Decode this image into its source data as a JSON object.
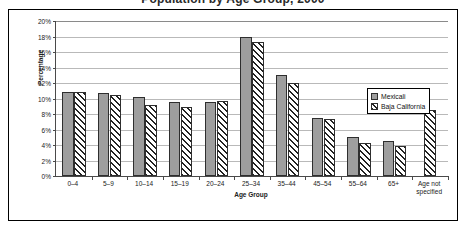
{
  "chart_data": {
    "type": "bar",
    "title": "Population by Age Group, 2000",
    "title_clipped": true,
    "xlabel": "Age Group",
    "ylabel": "Percentage",
    "ylim": [
      0,
      20
    ],
    "ytick_step": 2,
    "grid": true,
    "legend_position": "inside-right",
    "categories": [
      "0–4",
      "5–9",
      "10–14",
      "15–19",
      "20–24",
      "25–34",
      "35–44",
      "45–54",
      "55–64",
      "65+",
      "Age not\nspecified"
    ],
    "ytick_labels": [
      "0%",
      "2%",
      "4%",
      "6%",
      "8%",
      "10%",
      "12%",
      "14%",
      "16%",
      "18%",
      "20%"
    ],
    "series": [
      {
        "name": "Mexicali",
        "color": "#9e9e9e",
        "fill": "solid",
        "values": [
          10.8,
          10.7,
          10.2,
          9.6,
          9.6,
          18.0,
          13.0,
          7.5,
          5.0,
          4.5,
          null
        ]
      },
      {
        "name": "Baja California",
        "color": "#ffffff",
        "fill": "diagonal-hatch",
        "values": [
          10.8,
          10.5,
          9.2,
          8.9,
          9.7,
          17.3,
          12.0,
          7.3,
          4.3,
          3.9,
          8.5
        ]
      }
    ]
  },
  "legend": {
    "items": [
      {
        "label": "Mexicali"
      },
      {
        "label": "Baja California"
      }
    ]
  }
}
